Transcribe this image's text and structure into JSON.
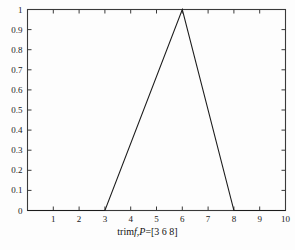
{
  "figure": {
    "background_color": "#fdfdfd",
    "axis_color": "#3a3a3a",
    "line_color": "#1c1c1c"
  },
  "xlabel_parts": {
    "prefix": "trim",
    "f_italic": "f",
    "comma": ",",
    "p_italic": "P",
    "equals": "=[3  6  8]"
  },
  "chart_data": {
    "type": "line",
    "title": "",
    "subtitle": "",
    "xlabel": "trimf,P=[3  6  8]",
    "ylabel": "",
    "xlim": [
      0,
      10
    ],
    "ylim": [
      0,
      1
    ],
    "grid": false,
    "legend": null,
    "legend_position": "none",
    "x_ticks": [
      0,
      1,
      2,
      3,
      4,
      5,
      6,
      7,
      8,
      9,
      10
    ],
    "x_tick_labels": [
      "",
      "1",
      "2",
      "3",
      "4",
      "5",
      "6",
      "7",
      "8",
      "9",
      "10"
    ],
    "y_ticks": [
      0,
      0.1,
      0.2,
      0.3,
      0.4,
      0.5,
      0.6,
      0.7,
      0.8,
      0.9,
      1
    ],
    "y_tick_labels": [
      "0",
      "0.1",
      "0.2",
      "0.3",
      "0.4",
      "0.5",
      "0.6",
      "0.7",
      "0.8",
      "0.9",
      "1"
    ],
    "series": [
      {
        "name": "trimf",
        "parameters": [
          3,
          6,
          8
        ],
        "x": [
          0,
          3,
          6,
          8,
          10
        ],
        "values": [
          0,
          0,
          1,
          0,
          0
        ]
      }
    ],
    "annotations": []
  }
}
